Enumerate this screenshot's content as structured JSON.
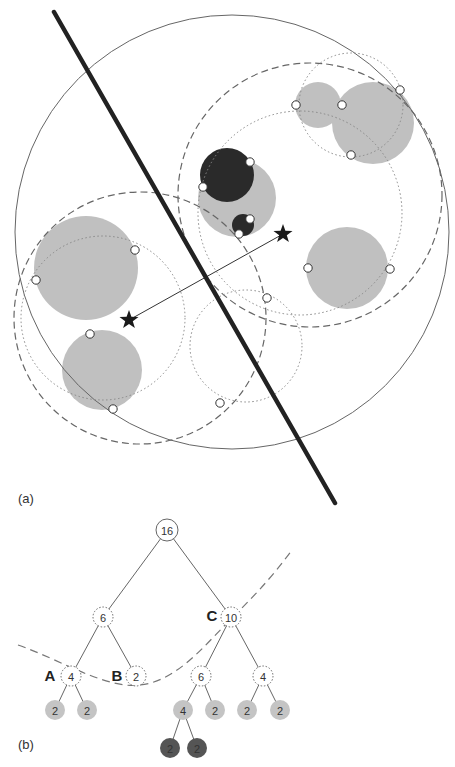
{
  "panels": {
    "a_label": "(a)",
    "b_label": "(b)"
  },
  "colors": {
    "gray_fill": "#c0c0c0",
    "dark_fill": "#2a2a2a",
    "stroke": "#555555",
    "line": "#222222",
    "leaf_light": "#c4c4c4",
    "leaf_dark": "#555555"
  },
  "diagram_a": {
    "outer_circle": {
      "cx": 232,
      "cy": 232,
      "r": 217
    },
    "separating_line": {
      "x1": 54,
      "y1": 12,
      "x2": 335,
      "y2": 503
    },
    "gray_circles": [
      {
        "cx": 318,
        "cy": 105,
        "r": 23
      },
      {
        "cx": 373,
        "cy": 123,
        "r": 41
      },
      {
        "cx": 237,
        "cy": 198,
        "r": 39
      },
      {
        "cx": 86,
        "cy": 268,
        "r": 52
      },
      {
        "cx": 347,
        "cy": 268,
        "r": 41
      },
      {
        "cx": 102,
        "cy": 370,
        "r": 40
      }
    ],
    "dark_circles": [
      {
        "cx": 227,
        "cy": 175,
        "r": 27
      },
      {
        "cx": 243,
        "cy": 225,
        "r": 11
      }
    ],
    "dashed_circles": [
      {
        "cx": 310,
        "cy": 195,
        "r": 132
      },
      {
        "cx": 140,
        "cy": 318,
        "r": 126
      }
    ],
    "dotted_circles": [
      {
        "cx": 351,
        "cy": 105,
        "r": 52
      },
      {
        "cx": 300,
        "cy": 213,
        "r": 102
      },
      {
        "cx": 103,
        "cy": 318,
        "r": 82
      },
      {
        "cx": 246,
        "cy": 346,
        "r": 56
      }
    ],
    "white_points": [
      [
        296,
        105
      ],
      [
        342,
        105
      ],
      [
        400,
        90
      ],
      [
        351,
        155
      ],
      [
        250,
        162
      ],
      [
        203,
        187
      ],
      [
        250,
        219
      ],
      [
        239,
        234
      ],
      [
        135,
        250
      ],
      [
        36,
        280
      ],
      [
        308,
        268
      ],
      [
        390,
        269
      ],
      [
        267,
        298
      ],
      [
        90,
        334
      ],
      [
        113,
        409
      ],
      [
        220,
        403
      ]
    ],
    "stars": [
      {
        "x": 283,
        "y": 234
      },
      {
        "x": 129,
        "y": 320
      }
    ],
    "arrow": {
      "x1": 283,
      "y1": 234,
      "x2": 129,
      "y2": 320
    }
  },
  "diagram_b": {
    "nodes": [
      {
        "id": "root",
        "x": 167,
        "y": 530,
        "label": "16",
        "style": "solid"
      },
      {
        "id": "n6",
        "x": 103,
        "y": 617,
        "label": "6",
        "style": "dotted"
      },
      {
        "id": "n10",
        "x": 231,
        "y": 617,
        "label": "10",
        "style": "dotted"
      },
      {
        "id": "nA",
        "x": 71,
        "y": 676,
        "label": "4",
        "style": "dotted"
      },
      {
        "id": "nB",
        "x": 136,
        "y": 676,
        "label": "2",
        "style": "dotted"
      },
      {
        "id": "n6r",
        "x": 201,
        "y": 676,
        "label": "6",
        "style": "dotted"
      },
      {
        "id": "n4r",
        "x": 263,
        "y": 676,
        "label": "4",
        "style": "dotted"
      },
      {
        "id": "l1",
        "x": 55,
        "y": 710,
        "label": "2",
        "style": "light"
      },
      {
        "id": "l2",
        "x": 87,
        "y": 710,
        "label": "2",
        "style": "light"
      },
      {
        "id": "l3",
        "x": 183,
        "y": 710,
        "label": "4",
        "style": "light"
      },
      {
        "id": "l4",
        "x": 215,
        "y": 710,
        "label": "2",
        "style": "light"
      },
      {
        "id": "l5",
        "x": 247,
        "y": 710,
        "label": "2",
        "style": "light"
      },
      {
        "id": "l6",
        "x": 280,
        "y": 710,
        "label": "2",
        "style": "light"
      },
      {
        "id": "d1",
        "x": 170,
        "y": 748,
        "label": "2",
        "style": "dark"
      },
      {
        "id": "d2",
        "x": 197,
        "y": 748,
        "label": "2",
        "style": "dark"
      }
    ],
    "edges": [
      [
        "root",
        "n6"
      ],
      [
        "root",
        "n10"
      ],
      [
        "n6",
        "nA"
      ],
      [
        "n6",
        "nB"
      ],
      [
        "n10",
        "n6r"
      ],
      [
        "n10",
        "n4r"
      ],
      [
        "nA",
        "l1"
      ],
      [
        "nA",
        "l2"
      ],
      [
        "n6r",
        "l3"
      ],
      [
        "n6r",
        "l4"
      ],
      [
        "n4r",
        "l5"
      ],
      [
        "n4r",
        "l6"
      ],
      [
        "l3",
        "d1"
      ],
      [
        "l3",
        "d2"
      ]
    ],
    "letters": [
      {
        "x": 50,
        "y": 675,
        "text": "A"
      },
      {
        "x": 117,
        "y": 675,
        "text": "B"
      },
      {
        "x": 212,
        "y": 615,
        "text": "C"
      }
    ],
    "cut_curve": "M 18 645 C 60 660, 90 680, 125 685 C 170 690, 200 650, 230 620 C 250 600, 270 580, 292 550"
  }
}
